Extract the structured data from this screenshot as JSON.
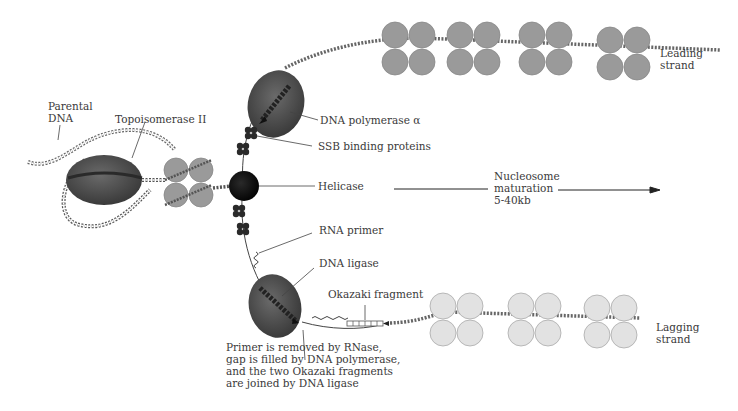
{
  "diagram": {
    "colors": {
      "background": "#ffffff",
      "text": "#3a3a3a",
      "enzyme_dark": "#4a4a4a",
      "helicase": "#111111",
      "ssb": "#2a2a2a",
      "nucleosome_leading": "#9a9a9a",
      "nucleosome_lagging": "#e2e2e2",
      "leader_line": "#444444"
    },
    "labels": {
      "parental_dna": "Parental\nDNA",
      "topoisomerase": "Topoisomerase II",
      "dna_polymerase": "DNA polymerase α",
      "ssb": "SSB binding proteins",
      "helicase": "Helicase",
      "rna_primer": "RNA primer",
      "dna_ligase": "DNA ligase",
      "okazaki": "Okazaki fragment",
      "primer_note": "Primer is removed by RNase,\ngap is filled by DNA polymerase,\nand the two Okazaki fragments\nare joined by DNA ligase",
      "nucleosome_maturation": "Nucleosome\nmaturation\n5-40kb",
      "leading_strand": "Leading\nstrand",
      "lagging_strand": "Lagging\nstrand"
    },
    "components": [
      {
        "name": "Parental DNA",
        "type": "double helix"
      },
      {
        "name": "Topoisomerase II",
        "type": "enzyme"
      },
      {
        "name": "Parental nucleosome",
        "type": "histone octamer"
      },
      {
        "name": "Helicase",
        "type": "enzyme"
      },
      {
        "name": "SSB binding proteins",
        "type": "protein cluster"
      },
      {
        "name": "DNA polymerase α",
        "type": "enzyme",
        "strand": "leading"
      },
      {
        "name": "RNA primer",
        "type": "nucleic acid",
        "strand": "lagging"
      },
      {
        "name": "DNA ligase",
        "type": "enzyme",
        "strand": "lagging"
      },
      {
        "name": "Okazaki fragment",
        "type": "nucleic acid",
        "strand": "lagging"
      },
      {
        "name": "Leading strand nucleosomes",
        "count": 4
      },
      {
        "name": "Lagging strand nucleosomes",
        "count": 3
      }
    ]
  }
}
